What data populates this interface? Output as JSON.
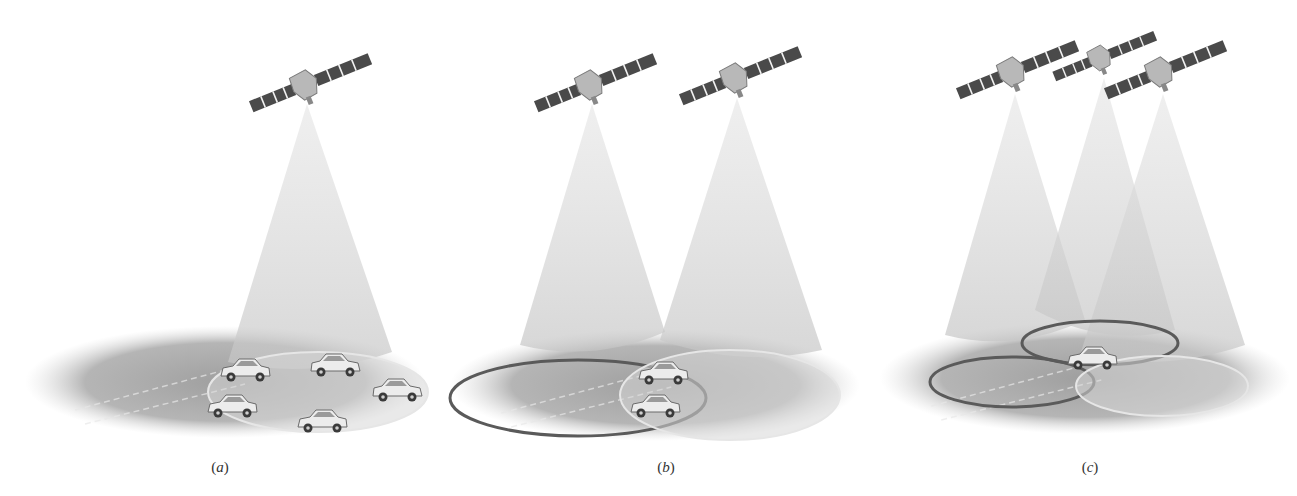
{
  "figure": {
    "panels": [
      {
        "id": "a",
        "label": "(a)",
        "satellites": [
          {
            "cx": 305,
            "cy": 85,
            "angle": -22,
            "scale": 1.0
          }
        ],
        "cones": [
          {
            "apex": [
              307,
              104
            ],
            "left": [
              228,
              362
            ],
            "right": [
              392,
              352
            ]
          }
        ],
        "ground": {
          "cx": 225,
          "cy": 382,
          "rx": 200,
          "ry": 56
        },
        "rings": [
          {
            "cx": 318,
            "cy": 392,
            "rx": 110,
            "ry": 40,
            "style": "light"
          }
        ],
        "cars": [
          {
            "x": 245,
            "y": 372,
            "flip": false
          },
          {
            "x": 336,
            "y": 367,
            "flip": true
          },
          {
            "x": 398,
            "y": 392,
            "flip": true
          },
          {
            "x": 232,
            "y": 408,
            "flip": false
          },
          {
            "x": 322,
            "y": 423,
            "flip": false
          }
        ],
        "label_pos": [
          220,
          472
        ]
      },
      {
        "id": "b",
        "label": "(b)",
        "satellites": [
          {
            "cx": 590,
            "cy": 85,
            "angle": -22,
            "scale": 1.0
          },
          {
            "cx": 735,
            "cy": 78,
            "angle": -22,
            "scale": 1.0
          }
        ],
        "cones": [
          {
            "apex": [
              592,
              104
            ],
            "left": [
              520,
              345
            ],
            "right": [
              665,
              332
            ]
          },
          {
            "apex": [
              737,
              98
            ],
            "left": [
              660,
              340
            ],
            "right": [
              822,
              350
            ]
          }
        ],
        "ground": {
          "cx": 655,
          "cy": 385,
          "rx": 205,
          "ry": 56
        },
        "rings": [
          {
            "cx": 578,
            "cy": 398,
            "rx": 128,
            "ry": 38,
            "style": "dark"
          },
          {
            "cx": 730,
            "cy": 395,
            "rx": 110,
            "ry": 45,
            "style": "light"
          }
        ],
        "cars": [
          {
            "x": 663,
            "y": 375,
            "flip": false
          },
          {
            "x": 655,
            "y": 408,
            "flip": false
          }
        ],
        "label_pos": [
          666,
          472
        ]
      },
      {
        "id": "c",
        "label": "(c)",
        "satellites": [
          {
            "cx": 1012,
            "cy": 72,
            "angle": -22,
            "scale": 1.0
          },
          {
            "cx": 1100,
            "cy": 58,
            "angle": -22,
            "scale": 0.85
          },
          {
            "cx": 1160,
            "cy": 72,
            "angle": -22,
            "scale": 1.0
          }
        ],
        "cones": [
          {
            "apex": [
              1015,
              94
            ],
            "left": [
              945,
              335
            ],
            "right": [
              1085,
              320
            ]
          },
          {
            "apex": [
              1104,
              78
            ],
            "left": [
              1035,
              310
            ],
            "right": [
              1175,
              330
            ]
          },
          {
            "apex": [
              1163,
              94
            ],
            "left": [
              1080,
              355
            ],
            "right": [
              1245,
              345
            ]
          }
        ],
        "ground": {
          "cx": 1085,
          "cy": 378,
          "rx": 205,
          "ry": 56
        },
        "rings": [
          {
            "cx": 1012,
            "cy": 382,
            "rx": 82,
            "ry": 25,
            "style": "dark"
          },
          {
            "cx": 1100,
            "cy": 343,
            "rx": 78,
            "ry": 22,
            "style": "dark"
          },
          {
            "cx": 1162,
            "cy": 386,
            "rx": 86,
            "ry": 30,
            "style": "light"
          }
        ],
        "cars": [
          {
            "x": 1092,
            "y": 360,
            "flip": false
          }
        ],
        "label_pos": [
          1090,
          472
        ]
      }
    ],
    "colors": {
      "background": "#ffffff",
      "ground_dark": "#8c8c8c",
      "ground_light": "#d6d6d6",
      "cone": "#c8c8c8",
      "ring_dark": "#5a5a5a",
      "ring_light": "#e6e6e6",
      "panel_fill": "#4a4a4a",
      "panel_stripe": "#f2f2f2",
      "body": "#b8b8b8",
      "car_body": "#ececec",
      "car_outline": "#6a6a6a",
      "label": "#333333"
    }
  }
}
